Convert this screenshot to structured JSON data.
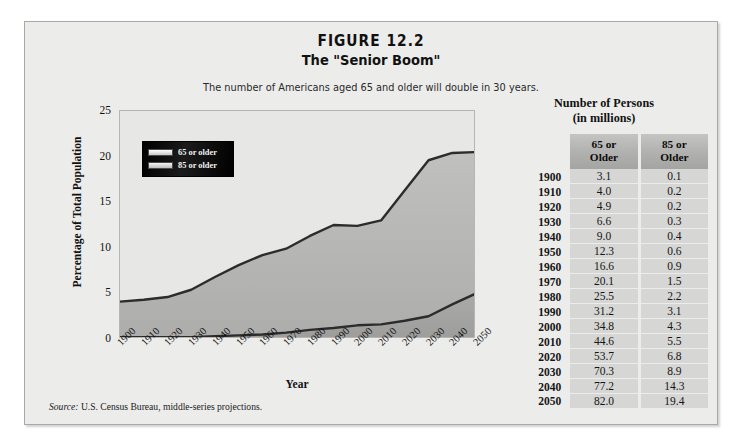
{
  "figure": {
    "number": "FIGURE 12.2",
    "subtitle": "The \"Senior Boom\"",
    "caption": "The number of Americans aged 65 and older will double in 30 years.",
    "source_label": "Source:",
    "source_text": " U.S. Census Bureau, middle-series projections."
  },
  "table": {
    "title_line1": "Number of Persons",
    "title_line2": "(in millions)",
    "year_header": "",
    "headers": [
      {
        "line1": "65 or",
        "line2": "Older"
      },
      {
        "line1": "85 or",
        "line2": "Older"
      }
    ],
    "rows": [
      {
        "year": "1900",
        "c65": "3.1",
        "c85": "0.1"
      },
      {
        "year": "1910",
        "c65": "4.0",
        "c85": "0.2"
      },
      {
        "year": "1920",
        "c65": "4.9",
        "c85": "0.2"
      },
      {
        "year": "1930",
        "c65": "6.6",
        "c85": "0.3"
      },
      {
        "year": "1940",
        "c65": "9.0",
        "c85": "0.4"
      },
      {
        "year": "1950",
        "c65": "12.3",
        "c85": "0.6"
      },
      {
        "year": "1960",
        "c65": "16.6",
        "c85": "0.9"
      },
      {
        "year": "1970",
        "c65": "20.1",
        "c85": "1.5"
      },
      {
        "year": "1980",
        "c65": "25.5",
        "c85": "2.2"
      },
      {
        "year": "1990",
        "c65": "31.2",
        "c85": "3.1"
      },
      {
        "year": "2000",
        "c65": "34.8",
        "c85": "4.3"
      },
      {
        "year": "2010",
        "c65": "44.6",
        "c85": "5.5"
      },
      {
        "year": "2020",
        "c65": "53.7",
        "c85": "6.8"
      },
      {
        "year": "2030",
        "c65": "70.3",
        "c85": "8.9"
      },
      {
        "year": "2040",
        "c65": "77.2",
        "c85": "14.3"
      },
      {
        "year": "2050",
        "c65": "82.0",
        "c85": "19.4"
      }
    ]
  },
  "chart_data": {
    "type": "area",
    "title": "The \"Senior Boom\"",
    "xlabel": "Year",
    "ylabel": "Percentage of Total Population",
    "x": [
      "1900",
      "1910",
      "1920",
      "1930",
      "1940",
      "1950",
      "1960",
      "1970",
      "1980",
      "1990",
      "2000",
      "2010",
      "2020",
      "2030",
      "2040",
      "2050"
    ],
    "xlim": [
      1900,
      2050
    ],
    "ylim": [
      0,
      25
    ],
    "yticks": [
      0,
      5,
      10,
      15,
      20,
      25
    ],
    "grid": false,
    "legend_position": "top-left",
    "series": [
      {
        "name": "65 or older",
        "values": [
          4.1,
          4.3,
          4.6,
          5.4,
          6.8,
          8.1,
          9.2,
          9.9,
          11.3,
          12.5,
          12.4,
          13.0,
          16.3,
          19.6,
          20.4,
          20.5
        ]
      },
      {
        "name": "85 or older",
        "values": [
          0.2,
          0.2,
          0.2,
          0.2,
          0.3,
          0.4,
          0.5,
          0.7,
          1.0,
          1.2,
          1.5,
          1.6,
          2.0,
          2.5,
          3.8,
          5.0
        ]
      }
    ]
  },
  "legend": {
    "items": [
      {
        "label": "65 or older"
      },
      {
        "label": "85 or older"
      }
    ]
  },
  "colors": {
    "panel_bg": "#ececeb",
    "plot_bg": "#e7e7e6",
    "area_fill_65": "#b9b9b7",
    "area_fill_85": "#a3a3a1",
    "line": "#2a2a2a",
    "table_header": "#b4b4b2",
    "table_cell": "#d6d6d4"
  }
}
